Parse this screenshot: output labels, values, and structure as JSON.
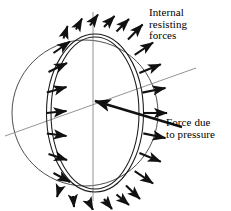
{
  "figure": {
    "background_color": "#ffffff",
    "ink_color": "#000000",
    "axis_color": "#777777",
    "width": 231,
    "height": 210
  },
  "labels": {
    "internal_resisting_forces": "Internal\nresisting\nforces",
    "force_due_to_pressure": "Force due\nto pressure"
  },
  "geometry": {
    "sphere": {
      "center_x": 85,
      "center_y": 113,
      "radius": 73,
      "description": "outer sphere outline circle"
    },
    "shell_ring": {
      "center_x": 95,
      "center_y": 113,
      "rx": 46,
      "ry": 77,
      "thickness": 5,
      "description": "double-lined elliptical great-circle shell section"
    },
    "vertical_axis": {
      "x": 93,
      "y1": 12,
      "y2": 201
    },
    "inclined_axis": {
      "x1": 5,
      "y1": 136,
      "x2": 196,
      "y2": 68
    },
    "pressure_arrow": {
      "x1": 182,
      "y1": 127,
      "x2": 93,
      "y2": 101,
      "head_at": "x2,y2"
    }
  },
  "arrows": {
    "count": 26,
    "description": "internal resisting force vectors radiating outward normal to the shell ring",
    "vectors": [
      {
        "angle_deg": 90,
        "label": "top"
      },
      {
        "angle_deg": 75,
        "label": "upper"
      },
      {
        "angle_deg": 60,
        "label": "upper"
      },
      {
        "angle_deg": 45,
        "label": "upper-right"
      },
      {
        "angle_deg": 30,
        "label": "right"
      },
      {
        "angle_deg": 15,
        "label": "right"
      },
      {
        "angle_deg": 0,
        "label": "right"
      },
      {
        "angle_deg": 345,
        "label": "right"
      },
      {
        "angle_deg": 330,
        "label": "lower-right"
      },
      {
        "angle_deg": 315,
        "label": "lower-right"
      },
      {
        "angle_deg": 300,
        "label": "lower"
      },
      {
        "angle_deg": 285,
        "label": "lower"
      },
      {
        "angle_deg": 270,
        "label": "bottom"
      },
      {
        "angle_deg": 255,
        "label": "lower"
      },
      {
        "angle_deg": 240,
        "label": "lower"
      },
      {
        "angle_deg": 225,
        "label": "lower-left"
      },
      {
        "angle_deg": 210,
        "label": "left"
      },
      {
        "angle_deg": 195,
        "label": "left"
      },
      {
        "angle_deg": 180,
        "label": "left"
      },
      {
        "angle_deg": 165,
        "label": "left"
      },
      {
        "angle_deg": 150,
        "label": "upper-left"
      },
      {
        "angle_deg": 135,
        "label": "upper-left"
      },
      {
        "angle_deg": 120,
        "label": "upper"
      },
      {
        "angle_deg": 105,
        "label": "upper"
      }
    ]
  }
}
